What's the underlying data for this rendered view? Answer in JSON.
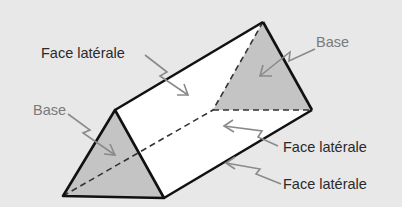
{
  "diagram": {
    "type": "triangular-prism",
    "labels": {
      "face_laterale_top": "Face latérale",
      "base_right": "Base",
      "base_left": "Base",
      "face_laterale_mid": "Face latérale",
      "face_laterale_bottom": "Face latérale"
    },
    "colors": {
      "background": "#e8e8e8",
      "base_fill": "#c4c4c4",
      "face_fill": "#ffffff",
      "edge": "#111111",
      "arrow": "#8a8a8a",
      "label_dark": "#2a2a2a",
      "label_base": "#7a7a7a"
    }
  }
}
